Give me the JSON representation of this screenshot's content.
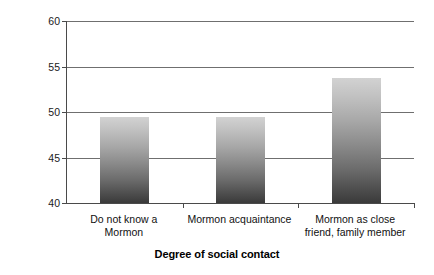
{
  "chart_data": {
    "type": "bar",
    "title": "",
    "xlabel": "Degree of social contact",
    "ylabel": "Feeling thermometer",
    "categories": [
      "Do not know a Mormon",
      "Mormon acquaintance",
      "Mormon as close friend, family member"
    ],
    "category_lines": [
      [
        "Do not know a",
        "Mormon"
      ],
      [
        "Mormon acquaintance",
        ""
      ],
      [
        "Mormon as close",
        "friend, family member"
      ]
    ],
    "values": [
      49.5,
      49.5,
      53.7
    ],
    "ylim": [
      40,
      60
    ],
    "yticks": [
      40,
      45,
      50,
      55,
      60
    ],
    "ytick_labels": [
      "40",
      "45",
      "50",
      "55",
      "60"
    ],
    "grid": true,
    "legend": "none",
    "bar_gradient_top": "#d2d2d2",
    "bar_gradient_bottom": "#3a3a3a",
    "axis_color": "#4a4a4a",
    "gridline_color": "#6f6f6f"
  }
}
